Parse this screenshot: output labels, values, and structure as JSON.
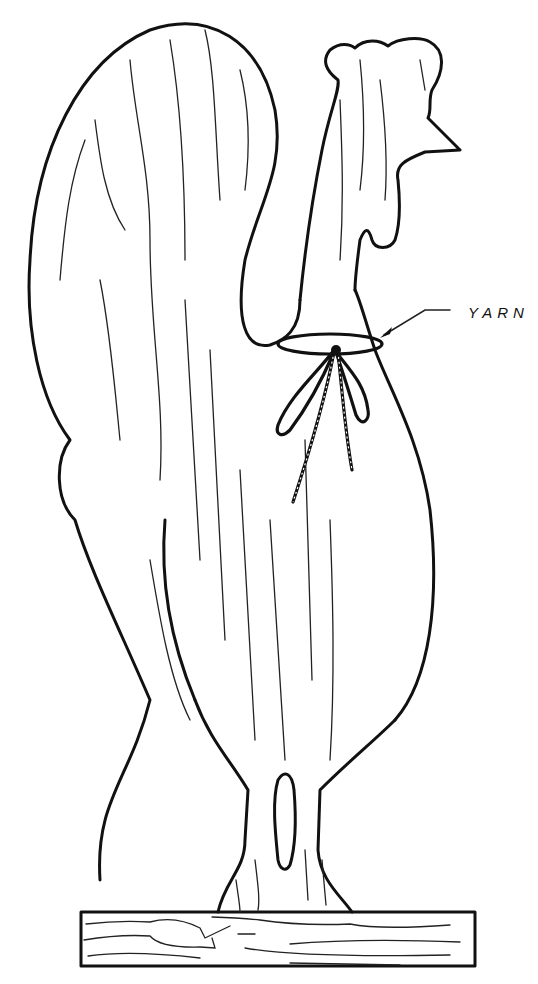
{
  "figure": {
    "callout": {
      "label": "YARN",
      "points_to": "yarn bow tied around rooster neck"
    },
    "parts": [
      "tail",
      "head-with-comb",
      "neck",
      "body",
      "leg-with-slot",
      "base-board"
    ]
  }
}
